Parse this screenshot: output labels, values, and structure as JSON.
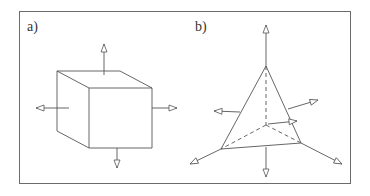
{
  "figure": {
    "panels": [
      {
        "id": "a",
        "label": "a)",
        "shape": "cube",
        "arrows": [
          "up",
          "down",
          "left",
          "right"
        ]
      },
      {
        "id": "b",
        "label": "b)",
        "shape": "tetrahedron",
        "arrows": [
          "up",
          "down",
          "upper-left",
          "upper-right",
          "lower-left",
          "lower-right",
          "inner"
        ]
      }
    ],
    "colors": {
      "stroke": "#555555",
      "frame": "#6b6b6b"
    }
  }
}
